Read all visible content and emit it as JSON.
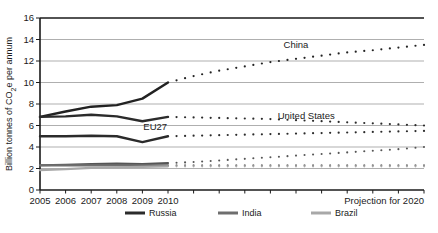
{
  "chart_data": {
    "type": "line",
    "title": "",
    "subtitle": "",
    "xlabel": "",
    "ylabel": "Billion tonnes of CO2e per annum",
    "ylabel_display": "Billion tonnes of CO₂e per annum",
    "xlim": [
      2005,
      2020
    ],
    "ylim": [
      0,
      16
    ],
    "ytick_step": 2,
    "yticks": [
      "0",
      "2",
      "4",
      "6",
      "8",
      "10",
      "12",
      "14",
      "16"
    ],
    "ytick_values": [
      0,
      2,
      4,
      6,
      8,
      10,
      12,
      14,
      16
    ],
    "xticks": [
      "2005",
      "2006",
      "2007",
      "2008",
      "2009",
      "2010"
    ],
    "xtick_values": [
      2005,
      2006,
      2007,
      2008,
      2009,
      2010
    ],
    "grid": "horizontal",
    "legend_position": "bottom",
    "projection_note": "Projection for 2020",
    "projection_start_year": 2010,
    "historical_years": [
      2005,
      2006,
      2007,
      2008,
      2009,
      2010
    ],
    "projection_years": [
      2010,
      2011,
      2012,
      2013,
      2014,
      2015,
      2016,
      2017,
      2018,
      2019,
      2020
    ],
    "series": [
      {
        "name": "China",
        "label_on_plot": "China",
        "style_historical": "solid",
        "style_projection": "dotted",
        "color": "#222222",
        "stroke_width": 2.4,
        "in_legend": false,
        "historical_values": [
          6.8,
          7.3,
          7.75,
          7.9,
          8.5,
          10.0
        ],
        "projection_values": [
          10.0,
          10.6,
          11.1,
          11.5,
          11.9,
          12.2,
          12.5,
          12.8,
          13.0,
          13.25,
          13.5
        ]
      },
      {
        "name": "Russia",
        "label_on_plot": "",
        "style_historical": "solid",
        "style_projection": "dotted",
        "color": "#2b2b2b",
        "stroke_width": 2.4,
        "in_legend": true,
        "historical_values": [
          6.8,
          6.85,
          7.0,
          6.85,
          6.4,
          6.8
        ],
        "projection_values": [
          6.8,
          6.75,
          6.7,
          6.65,
          6.6,
          6.5,
          6.4,
          6.3,
          6.2,
          6.1,
          6.0
        ]
      },
      {
        "name": "United States",
        "label_on_plot": "United States",
        "style_historical": "solid",
        "style_projection": "dotted",
        "color": "#2b2b2b",
        "stroke_width": 2.4,
        "in_legend": false,
        "historical_values": [
          5.0,
          5.0,
          5.05,
          5.0,
          4.45,
          5.0
        ],
        "projection_values": [
          5.0,
          5.05,
          5.1,
          5.15,
          5.2,
          5.25,
          5.3,
          5.35,
          5.4,
          5.45,
          5.5
        ]
      },
      {
        "name": "EU27",
        "label_on_plot": "EU27",
        "style_historical": "solid",
        "style_projection": "dotted",
        "color": "#555555",
        "stroke_width": 2.2,
        "in_legend": false,
        "historical_values": [
          2.3,
          2.35,
          2.4,
          2.45,
          2.4,
          2.5
        ],
        "projection_values": [
          2.5,
          2.6,
          2.75,
          2.9,
          3.05,
          3.2,
          3.35,
          3.5,
          3.65,
          3.8,
          4.0
        ]
      },
      {
        "name": "India",
        "label_on_plot": "",
        "style_historical": "solid",
        "style_projection": "dotted",
        "color": "#6e6e6e",
        "stroke_width": 2.2,
        "in_legend": true,
        "historical_values": [
          2.3,
          2.3,
          2.3,
          2.3,
          2.3,
          2.3
        ],
        "projection_values": [
          2.3,
          2.3,
          2.3,
          2.3,
          2.3,
          2.3,
          2.3,
          2.3,
          2.3,
          2.3,
          2.3
        ]
      },
      {
        "name": "Brazil",
        "label_on_plot": "",
        "style_historical": "solid",
        "style_projection": "dotted",
        "color": "#a8a8a8",
        "stroke_width": 2.2,
        "in_legend": true,
        "historical_values": [
          1.85,
          1.95,
          2.05,
          2.1,
          2.15,
          2.2
        ],
        "projection_values": [
          2.2,
          2.2,
          2.2,
          2.2,
          2.2,
          2.2,
          2.2,
          2.2,
          2.2,
          2.2,
          2.2
        ]
      }
    ],
    "legend": [
      {
        "label": "Russia",
        "color": "#2b2b2b"
      },
      {
        "label": "India",
        "color": "#6e6e6e"
      },
      {
        "label": "Brazil",
        "color": "#a8a8a8"
      }
    ],
    "plot_labels": [
      {
        "text": "China",
        "year": 2015.0,
        "value": 13.2
      },
      {
        "text": "United States",
        "year": 2015.4,
        "value": 6.6
      },
      {
        "text": "EU27",
        "year": 2009.5,
        "value": 5.6
      }
    ]
  }
}
